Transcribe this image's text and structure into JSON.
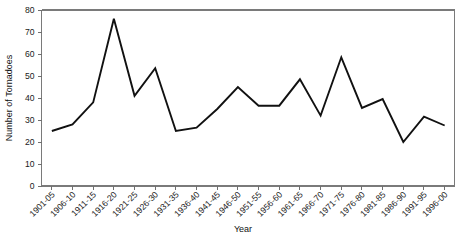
{
  "chart_data": {
    "type": "line",
    "title": "",
    "subtitle": "",
    "xlabel": "Year",
    "ylabel": "Number of Tornadoes",
    "categories": [
      "1901-05",
      "1906-10",
      "1911-15",
      "1916-20",
      "1921-25",
      "1926-30",
      "1931-35",
      "1936-40",
      "1941-45",
      "1946-50",
      "1951-55",
      "1956-60",
      "1961-65",
      "1966-70",
      "1971-75",
      "1976-80",
      "1981-85",
      "1986-90",
      "1991-95",
      "1996-00"
    ],
    "values": [
      25,
      28,
      38,
      76,
      41,
      53.5,
      25,
      26.5,
      35,
      45,
      36.5,
      36.5,
      48.5,
      32,
      58.5,
      35.5,
      39.5,
      20,
      31.5,
      27.5
    ],
    "series": [
      {
        "name": "Number of Tornadoes",
        "values": [
          25,
          28,
          38,
          76,
          41,
          53.5,
          25,
          26.5,
          35,
          45,
          36.5,
          36.5,
          48.5,
          32,
          58.5,
          35.5,
          39.5,
          20,
          31.5,
          27.5
        ],
        "color": "#111111"
      }
    ],
    "ylim": [
      0,
      80
    ],
    "ytick_values": [
      0,
      10,
      20,
      30,
      40,
      50,
      60,
      70,
      80
    ],
    "ytick_labels": [
      "0",
      "10",
      "20",
      "30",
      "40",
      "50",
      "60",
      "70",
      "80"
    ],
    "grid": false,
    "legend": false,
    "legend_position": "none",
    "xtick_rotation": -45,
    "line_color": "#111111",
    "axis_color": "#7a7a7a",
    "background_color": "#ffffff"
  }
}
